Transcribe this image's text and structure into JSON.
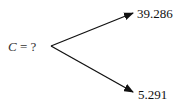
{
  "diagram": {
    "type": "binomial-tree-branch",
    "root": {
      "label_var": "C",
      "label_eq": " = ?",
      "position": {
        "x": 51,
        "y": 46
      }
    },
    "branches": [
      {
        "name": "up",
        "value": "39.286",
        "tip": {
          "x": 134,
          "y": 12
        }
      },
      {
        "name": "down",
        "value": "5.291",
        "tip": {
          "x": 134,
          "y": 93
        }
      }
    ],
    "colors": {
      "line": "#111111",
      "text": "#222222",
      "background": "#ffffff"
    }
  }
}
